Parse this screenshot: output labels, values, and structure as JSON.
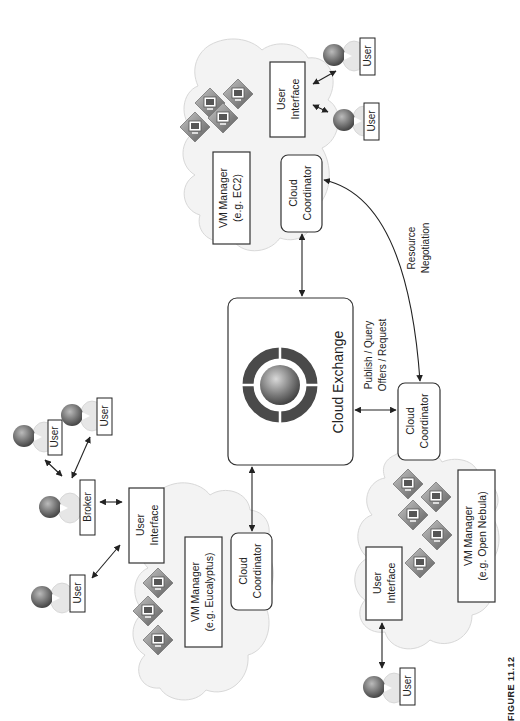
{
  "figure": {
    "caption": "FIGURE 11.12",
    "orientation": "rotated-90-ccw",
    "colors": {
      "box_stroke": "#333333",
      "cloud_fill": "#f3f3f3",
      "vm_fill": "#8a8a8a",
      "ring": "#4a4a4a"
    }
  },
  "center": {
    "title": "Cloud Exchange",
    "publish_label_line1": "Publish / Query",
    "publish_label_line2": "Offers / Request",
    "negotiation_line1": "Resource",
    "negotiation_line2": "Negotiation"
  },
  "clouds": {
    "ec2": {
      "vm_manager_line1": "VM Manager",
      "vm_manager_line2": "(e.g. EC2)",
      "coordinator_line1": "Cloud",
      "coordinator_line2": "Coordinator",
      "ui_line1": "User",
      "ui_line2": "Interface",
      "users": [
        "User",
        "User"
      ],
      "vm_count": 4
    },
    "eucalyptus": {
      "vm_manager_line1": "VM Manager",
      "vm_manager_line2": "(e.g. Eucalyptus)",
      "coordinator_line1": "Cloud",
      "coordinator_line2": "Coordinator",
      "ui_line1": "User",
      "ui_line2": "Interface",
      "broker": "Broker",
      "users": [
        "User",
        "User",
        "User"
      ],
      "vm_count": 3
    },
    "opennebula": {
      "vm_manager_line1": "VM Manager",
      "vm_manager_line2": "(e.g. Open Nebula)",
      "coordinator_line1": "Cloud",
      "coordinator_line2": "Coordinator",
      "ui_line1": "User",
      "ui_line2": "Interface",
      "users": [
        "User"
      ],
      "vm_count": 5
    }
  }
}
